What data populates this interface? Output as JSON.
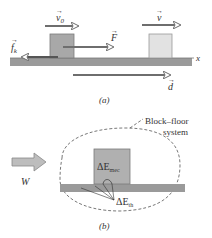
{
  "panel_a": {
    "caption": "(a)",
    "labels": {
      "v0": "v",
      "v0_sub": "0",
      "v": "v",
      "F": "F",
      "fk": "f",
      "fk_sub": "k",
      "d": "d",
      "x_axis": "x"
    },
    "colors": {
      "floor": "#9a9a9a",
      "block_initial": "#a8a8a8",
      "block_final": "#e2e2e2",
      "arrow": "#6e6e6e",
      "block_edge": "#7a7a7a"
    }
  },
  "panel_b": {
    "caption": "(b)",
    "system_label_line1": "Block–floor",
    "system_label_line2": "system",
    "work_label": "W",
    "block_label": "ΔE",
    "block_label_sub": "mec",
    "thermal_label": "ΔE",
    "thermal_label_sub": "th",
    "colors": {
      "floor": "#9a9a9a",
      "block": "#b0b0b0",
      "work_arrow": "#bdbdbd",
      "boundary": "#555555"
    }
  }
}
